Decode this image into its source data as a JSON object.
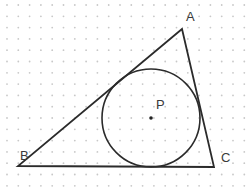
{
  "diagram": {
    "grid": {
      "type": "dot",
      "spacing": 11.3,
      "origin": [
        7,
        5
      ],
      "color": "#c8c8c8"
    },
    "triangle": {
      "vertices": {
        "A": {
          "label": "A",
          "x": 182,
          "y": 29,
          "label_x": 186,
          "label_y": 10
        },
        "B": {
          "label": "B",
          "x": 18,
          "y": 166,
          "label_x": 20,
          "label_y": 149
        },
        "C": {
          "label": "C",
          "x": 214,
          "y": 167,
          "label_x": 221,
          "label_y": 151
        }
      },
      "stroke": "#2b2b2b"
    },
    "incircle": {
      "center_label": "P",
      "cx": 151,
      "cy": 118,
      "r": 49,
      "label_x": 156,
      "label_y": 98,
      "stroke": "#2b2b2b"
    }
  }
}
